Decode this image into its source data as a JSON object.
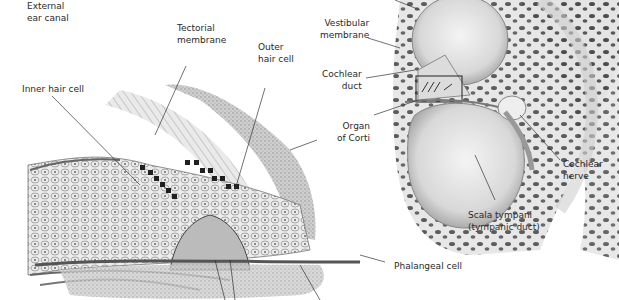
{
  "diagram": {
    "labels": {
      "external_ear_canal": "External\near canal",
      "tectorial_membrane": "Tectorial\nmembrane",
      "outer_hair_cell": "Outer\nhair cell",
      "inner_hair_cell": "Inner hair cell",
      "vestibular_membrane": "Vestibular\nmembrane",
      "cochlear_duct": "Cochlear\nduct",
      "organ_of_corti": "Organ\nof Corti",
      "cochlear_nerve": "Cochlear\nnerve",
      "scala_tympani": "Scala tympani\n(tympanic duct)",
      "phalangeal_cell": "Phalangeal cell"
    },
    "colors": {
      "background": "#ffffff",
      "ink": "#2a2a2a",
      "tissue_light": "#e6e6e6",
      "tissue_mid": "#b5b5b5",
      "tissue_dark": "#555555",
      "bone_spots": "#4a4a4a"
    }
  }
}
